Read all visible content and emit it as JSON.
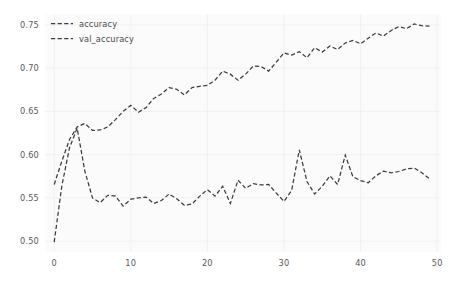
{
  "chart_data": {
    "type": "line",
    "title": "",
    "xlabel": "",
    "ylabel": "",
    "xlim": [
      -1.2,
      50.5
    ],
    "ylim": [
      0.4875,
      0.7625
    ],
    "xticks": [
      0,
      10,
      20,
      30,
      40,
      50
    ],
    "xtick_labels": [
      "0",
      "10",
      "20",
      "30",
      "40",
      "50"
    ],
    "yticks": [
      0.5,
      0.55,
      0.6,
      0.65,
      0.7,
      0.75
    ],
    "ytick_labels": [
      "0.50",
      "0.55",
      "0.60",
      "0.65",
      "0.70",
      "0.75"
    ],
    "grid": true,
    "grid_color": "#f0f0f0",
    "background": "#fbfbfb",
    "figure_background": "#ffffff",
    "legend_position": "upper left",
    "legend_frame": false,
    "linestyle": "dashed",
    "x": [
      0,
      1,
      2,
      3,
      4,
      5,
      6,
      7,
      8,
      9,
      10,
      11,
      12,
      13,
      14,
      15,
      16,
      17,
      18,
      19,
      20,
      21,
      22,
      23,
      24,
      25,
      26,
      27,
      28,
      29,
      30,
      31,
      32,
      33,
      34,
      35,
      36,
      37,
      38,
      39,
      40,
      41,
      42,
      43,
      44,
      45,
      46,
      47,
      48,
      49
    ],
    "series": [
      {
        "name": "accuracy",
        "color": "#3c3c3c",
        "linestyle": "dashed",
        "values": [
          0.5655,
          0.5925,
          0.6175,
          0.632,
          0.636,
          0.628,
          0.6285,
          0.632,
          0.6405,
          0.65,
          0.657,
          0.649,
          0.6545,
          0.665,
          0.67,
          0.6775,
          0.6755,
          0.669,
          0.6775,
          0.679,
          0.68,
          0.686,
          0.6965,
          0.693,
          0.686,
          0.693,
          0.7025,
          0.702,
          0.6965,
          0.707,
          0.7175,
          0.715,
          0.719,
          0.712,
          0.7235,
          0.7185,
          0.7255,
          0.7215,
          0.729,
          0.732,
          0.728,
          0.7345,
          0.7405,
          0.737,
          0.7435,
          0.748,
          0.7455,
          0.751,
          0.749,
          0.7485
        ]
      },
      {
        "name": "val_accuracy",
        "color": "#3c3c3c",
        "linestyle": "dashed",
        "values": [
          0.499,
          0.564,
          0.608,
          0.6305,
          0.581,
          0.55,
          0.5445,
          0.553,
          0.552,
          0.5405,
          0.5485,
          0.55,
          0.551,
          0.5435,
          0.547,
          0.5545,
          0.549,
          0.5415,
          0.543,
          0.552,
          0.5595,
          0.552,
          0.5635,
          0.5435,
          0.5705,
          0.561,
          0.5665,
          0.565,
          0.5655,
          0.5555,
          0.546,
          0.5585,
          0.6055,
          0.569,
          0.5545,
          0.5635,
          0.5755,
          0.5655,
          0.5995,
          0.5745,
          0.57,
          0.5675,
          0.5755,
          0.581,
          0.579,
          0.5805,
          0.5835,
          0.5845,
          0.579,
          0.572
        ]
      }
    ]
  }
}
